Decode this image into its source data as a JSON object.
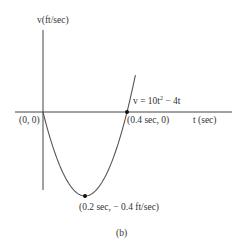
{
  "chart_data": {
    "type": "line",
    "title": "",
    "xlabel": "t (sec)",
    "ylabel": "v(ft/sec)",
    "equation": "v = 10t² − 4t",
    "caption": "(b)",
    "xlim": [
      -0.13,
      0.9
    ],
    "ylim": [
      -0.45,
      0.4
    ],
    "grid": false,
    "series": [
      {
        "name": "v = 10t² − 4t",
        "x": [
          0,
          0.05,
          0.1,
          0.15,
          0.2,
          0.25,
          0.3,
          0.35,
          0.4,
          0.44
        ],
        "values": [
          0,
          -0.175,
          -0.3,
          -0.375,
          -0.4,
          -0.375,
          -0.3,
          -0.175,
          0,
          0.176
        ]
      }
    ],
    "annotations": [
      {
        "point": [
          0,
          0
        ],
        "label": "(0, 0)"
      },
      {
        "point": [
          0.4,
          0
        ],
        "label": "(0.4 sec, 0)"
      },
      {
        "point": [
          0.2,
          -0.4
        ],
        "label": "(0.2 sec, − 0.4 ft/sec)"
      }
    ]
  },
  "labels": {
    "y_axis": "v(ft/sec)",
    "x_axis": "t (sec)",
    "equation_prefix": "v = 10t",
    "equation_exp": "2",
    "equation_suffix": " − 4t",
    "origin": "(0, 0)",
    "root": "(0.4 sec, 0)",
    "minimum": "(0.2 sec, − 0.4 ft/sec)",
    "caption": "(b)"
  }
}
